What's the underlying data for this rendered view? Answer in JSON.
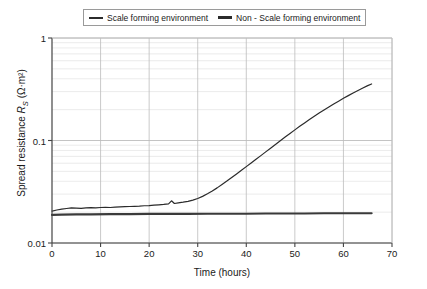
{
  "chart_data": {
    "type": "line",
    "title": "",
    "xlabel": "Time (hours)",
    "ylabel": "Spread resistance R_S (Ω·m²)",
    "ylabel_parts": {
      "prefix": "Spread resistance ",
      "symbol": "R",
      "subscript": "S",
      "units": " (Ω·m²)"
    },
    "xscale": "linear",
    "yscale": "log",
    "xlim": [
      0,
      70
    ],
    "ylim": [
      0.01,
      1
    ],
    "xticks": [
      0,
      10,
      20,
      30,
      40,
      50,
      60,
      70
    ],
    "xticklabels": [
      "0",
      "10",
      "20",
      "30",
      "40",
      "50",
      "60",
      "70"
    ],
    "yticks": [
      0.01,
      0.1,
      1
    ],
    "yticklabels": [
      "0.01",
      "0.1",
      "1"
    ],
    "grid": "horizontal-minor-and-major-log, vertical-major",
    "legend_position": "above-axes-center",
    "series": [
      {
        "name": "Scale forming environment",
        "color": "#2b2b2b",
        "linewidth": 1.2,
        "x": [
          0.0,
          1.0,
          2.0,
          3.0,
          4.0,
          5.0,
          6.0,
          7.0,
          8.0,
          9.0,
          10.0,
          11.0,
          12.0,
          13.0,
          14.0,
          15.0,
          16.0,
          17.0,
          18.0,
          19.0,
          20.0,
          21.0,
          22.0,
          23.0,
          24.0,
          24.6,
          25.2,
          26.0,
          27.0,
          28.0,
          29.0,
          30.0,
          31.0,
          32.0,
          33.0,
          34.0,
          35.0,
          36.0,
          37.0,
          38.0,
          39.0,
          40.0,
          41.0,
          42.0,
          43.0,
          44.0,
          45.0,
          46.0,
          47.0,
          48.0,
          49.0,
          50.0,
          51.0,
          52.0,
          53.0,
          54.0,
          55.0,
          56.0,
          57.0,
          58.0,
          59.0,
          60.0,
          61.0,
          62.0,
          63.0,
          64.0,
          65.0,
          65.8
        ],
        "y": [
          0.0205,
          0.021,
          0.0214,
          0.0217,
          0.022,
          0.0219,
          0.0218,
          0.022,
          0.0221,
          0.022,
          0.0222,
          0.0223,
          0.0222,
          0.0224,
          0.0225,
          0.0226,
          0.0227,
          0.0228,
          0.0229,
          0.0231,
          0.0232,
          0.0234,
          0.0236,
          0.0238,
          0.0241,
          0.0258,
          0.0243,
          0.0246,
          0.025,
          0.0255,
          0.0262,
          0.0272,
          0.0285,
          0.0302,
          0.0322,
          0.0345,
          0.0372,
          0.0402,
          0.0436,
          0.0472,
          0.0512,
          0.0556,
          0.0604,
          0.0656,
          0.0712,
          0.0775,
          0.0842,
          0.0915,
          0.0995,
          0.108,
          0.117,
          0.127,
          0.1375,
          0.1485,
          0.16,
          0.172,
          0.185,
          0.1985,
          0.2125,
          0.227,
          0.242,
          0.258,
          0.274,
          0.291,
          0.308,
          0.325,
          0.343,
          0.356
        ]
      },
      {
        "name": "Non - Scale forming environment",
        "color": "#3a3a3a",
        "linewidth": 2.2,
        "x": [
          0.0,
          2.0,
          5.0,
          8.0,
          12.0,
          16.0,
          20.0,
          24.0,
          28.0,
          32.0,
          36.0,
          40.0,
          44.0,
          48.0,
          52.0,
          56.0,
          60.0,
          63.0,
          65.8
        ],
        "y": [
          0.0188,
          0.0189,
          0.019,
          0.019,
          0.0191,
          0.0191,
          0.0192,
          0.0192,
          0.0192,
          0.0193,
          0.0193,
          0.0193,
          0.0194,
          0.0194,
          0.0194,
          0.0195,
          0.0195,
          0.0195,
          0.0195
        ]
      }
    ]
  },
  "legend": {
    "items": [
      {
        "label": "Scale forming environment",
        "style": "thin"
      },
      {
        "label": "Non - Scale forming environment",
        "style": "thick"
      }
    ]
  },
  "colors": {
    "axis": "#444444",
    "major_grid": "#bdbdbd",
    "minor_grid": "#e2e2e2",
    "series_1": "#2b2b2b",
    "series_2": "#3a3a3a",
    "legend_border": "#9a9a9a"
  }
}
